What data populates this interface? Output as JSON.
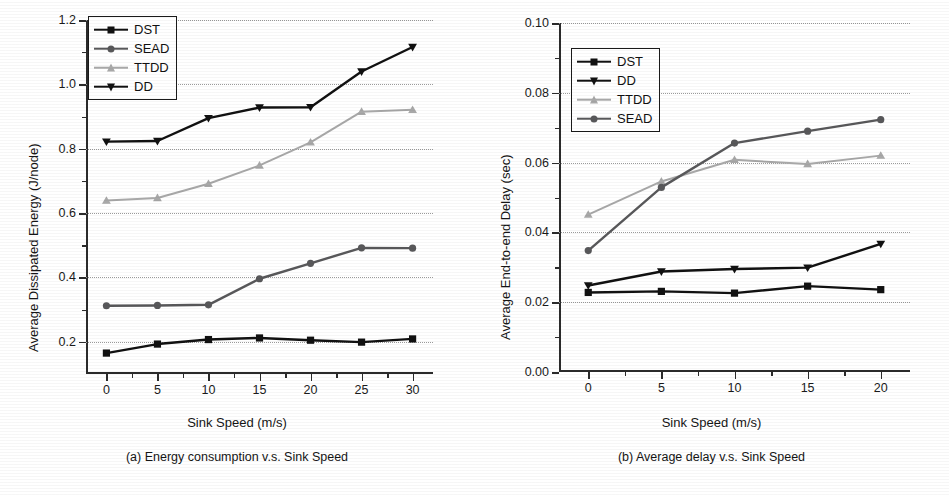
{
  "chart_data": [
    {
      "type": "line",
      "panel_id": "a",
      "title": "(a) Energy consumption v.s. Sink Speed",
      "xlabel": "Sink Speed (m/s)",
      "ylabel": "Average Dissipated Energy (J/node)",
      "x": [
        0,
        5,
        10,
        15,
        20,
        25,
        30
      ],
      "xlim": [
        -2,
        32
      ],
      "ylim": [
        0.1,
        1.2
      ],
      "xticks": [
        "0",
        "5",
        "10",
        "15",
        "20",
        "25",
        "30"
      ],
      "yticks": [
        "0.2",
        "0.4",
        "0.6",
        "0.8",
        "1.0",
        "1.2"
      ],
      "ytick_values": [
        0.2,
        0.4,
        0.6,
        0.8,
        1.0,
        1.2
      ],
      "grid": "horizontal-dotted",
      "legend_position": "top-left",
      "series": [
        {
          "name": "DST",
          "marker": "square",
          "color": "#111111",
          "values": [
            0.165,
            0.193,
            0.207,
            0.212,
            0.205,
            0.199,
            0.209
          ]
        },
        {
          "name": "SEAD",
          "marker": "circle",
          "color": "#58585a",
          "values": [
            0.312,
            0.313,
            0.315,
            0.396,
            0.444,
            0.492,
            0.491
          ]
        },
        {
          "name": "TTDD",
          "marker": "triangle-up",
          "color": "#a8a8a8",
          "values": [
            0.639,
            0.647,
            0.691,
            0.748,
            0.82,
            0.915,
            0.921
          ]
        },
        {
          "name": "DD",
          "marker": "triangle-down",
          "color": "#111111",
          "values": [
            0.822,
            0.824,
            0.895,
            0.928,
            0.929,
            1.04,
            1.116
          ]
        }
      ]
    },
    {
      "type": "line",
      "panel_id": "b",
      "title": "(b) Average delay v.s. Sink Speed",
      "xlabel": "Sink Speed (m/s)",
      "ylabel": "Average End-to-end Delay (sec)",
      "x": [
        0,
        5,
        10,
        15,
        20
      ],
      "xlim": [
        -2,
        22
      ],
      "ylim": [
        0.0,
        0.1
      ],
      "xticks": [
        "0",
        "5",
        "10",
        "15",
        "20"
      ],
      "yticks": [
        "0.00",
        "0.02",
        "0.04",
        "0.06",
        "0.08",
        "0.10"
      ],
      "ytick_values": [
        0.0,
        0.02,
        0.04,
        0.06,
        0.08,
        0.1
      ],
      "grid": "horizontal-dotted",
      "legend_position": "top-left",
      "series": [
        {
          "name": "DST",
          "marker": "square",
          "color": "#111111",
          "values": [
            0.0228,
            0.0231,
            0.0226,
            0.0246,
            0.0236
          ]
        },
        {
          "name": "DD",
          "marker": "triangle-down",
          "color": "#111111",
          "values": [
            0.0248,
            0.0288,
            0.0295,
            0.0299,
            0.0367
          ]
        },
        {
          "name": "TTDD",
          "marker": "triangle-up",
          "color": "#a8a8a8",
          "values": [
            0.0451,
            0.0546,
            0.0608,
            0.0596,
            0.062
          ]
        },
        {
          "name": "SEAD",
          "marker": "circle",
          "color": "#58585a",
          "values": [
            0.0348,
            0.0529,
            0.0656,
            0.069,
            0.0723
          ]
        }
      ]
    }
  ],
  "panels": [
    {
      "ylabel": "Average Dissipated Energy (J/node)",
      "xlabel": "Sink Speed (m/s)",
      "caption": "(a) Energy consumption v.s. Sink Speed",
      "legend": [
        {
          "label": "DST"
        },
        {
          "label": "SEAD"
        },
        {
          "label": "TTDD"
        },
        {
          "label": "DD"
        }
      ]
    },
    {
      "ylabel": "Average End-to-end Delay (sec)",
      "xlabel": "Sink Speed (m/s)",
      "caption": "(b) Average delay v.s. Sink Speed",
      "legend": [
        {
          "label": "DST"
        },
        {
          "label": "DD"
        },
        {
          "label": "TTDD"
        },
        {
          "label": "SEAD"
        }
      ]
    }
  ],
  "colors": {
    "black": "#111111",
    "dark_gray": "#58585a",
    "light_gray": "#a8a8a8",
    "grid": "#9a9a9a",
    "axis": "#2b2b2b",
    "background": "#ffffff"
  }
}
